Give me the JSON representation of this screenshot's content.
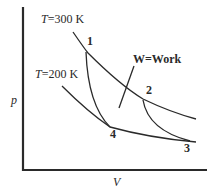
{
  "diagram": {
    "type": "pV diagram - Carnot cycle",
    "axes": {
      "x_label": "V",
      "y_label": "p"
    },
    "isotherms": [
      {
        "name": "T",
        "value": "=300 K",
        "label": "T=300 K"
      },
      {
        "name": "T",
        "value": "=200 K",
        "label": "T=200 K"
      }
    ],
    "points": [
      {
        "id": "1",
        "label": "1"
      },
      {
        "id": "2",
        "label": "2"
      },
      {
        "id": "3",
        "label": "3"
      },
      {
        "id": "4",
        "label": "4"
      }
    ],
    "annotation": {
      "label": "W=Work"
    },
    "colors": {
      "line": "#2a2a2a",
      "background": "#ffffff"
    }
  }
}
